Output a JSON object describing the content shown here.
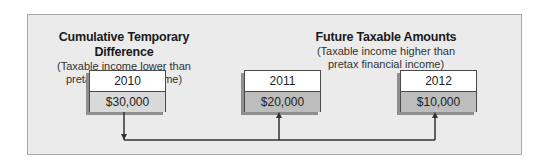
{
  "left_heading": {
    "title": "Cumulative Temporary Difference",
    "sub_line1": "(Taxable income lower than",
    "sub_line2": "pretax financial income)"
  },
  "right_heading": {
    "title": "Future Taxable Amounts",
    "sub_line1": "(Taxable income higher than",
    "sub_line2": "pretax financial income)"
  },
  "boxes": [
    {
      "year": "2010",
      "amount": "$30,000",
      "arrow": "down"
    },
    {
      "year": "2011",
      "amount": "$20,000",
      "arrow": "up"
    },
    {
      "year": "2012",
      "amount": "$10,000",
      "arrow": "up"
    }
  ],
  "colors": {
    "panel_bg": "#ebebeb",
    "panel_border": "#a9a9a9",
    "amount_light": "#d9d9d9",
    "amount_dark": "#bdbdbd",
    "line": "#333333"
  }
}
